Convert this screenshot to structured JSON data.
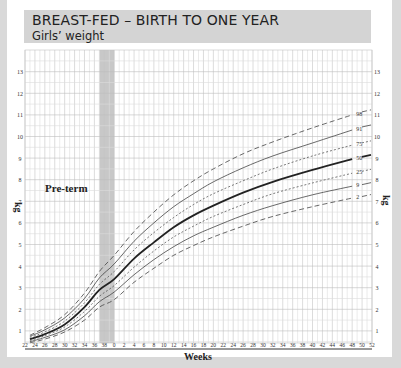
{
  "header": {
    "title": "BREAST-FED – BIRTH TO ONE YEAR",
    "subtitle": "Girls’ weight"
  },
  "chart_data": {
    "type": "line",
    "title": "BREAST-FED – BIRTH TO ONE YEAR",
    "subtitle": "Girls’ weight",
    "xlabel": "Weeks",
    "ylabel": "kg",
    "annotation": "Pre-term",
    "ylim": [
      0.4,
      13.8
    ],
    "y_ticks": [
      1,
      2,
      3,
      4,
      5,
      6,
      7,
      8,
      9,
      10,
      11,
      12,
      13
    ],
    "x_tick_labels": [
      "22",
      "24",
      "26",
      "28",
      "30",
      "32",
      "34",
      "36",
      "38",
      "0",
      "2",
      "4",
      "6",
      "8",
      "10",
      "12",
      "14",
      "16",
      "18",
      "20",
      "22",
      "24",
      "26",
      "28",
      "30",
      "32",
      "34",
      "36",
      "38",
      "40",
      "42",
      "44",
      "46",
      "48",
      "50",
      "52"
    ],
    "shaded_band": {
      "from_gest_week": 37,
      "to_gest_week": 40,
      "color": "#c8c8c8"
    },
    "grid": true,
    "x_note": "x values < 0 are gestational weeks before term (x = gestational week - 40); x >= 0 are postnatal weeks",
    "x": [
      -17,
      -14,
      -10,
      -6,
      -3,
      0,
      4,
      8,
      12,
      16,
      20,
      26,
      32,
      40,
      48
    ],
    "series": [
      {
        "name": "98",
        "style": "dashed",
        "values": [
          0.8,
          1.15,
          1.75,
          2.75,
          3.75,
          4.5,
          5.6,
          6.5,
          7.3,
          7.95,
          8.5,
          9.2,
          9.75,
          10.4,
          11.0
        ]
      },
      {
        "name": "91",
        "style": "solid",
        "values": [
          0.75,
          1.05,
          1.6,
          2.5,
          3.45,
          4.1,
          5.15,
          6.0,
          6.75,
          7.35,
          7.9,
          8.55,
          9.1,
          9.7,
          10.3
        ]
      },
      {
        "name": "75",
        "style": "dotted",
        "values": [
          0.7,
          0.95,
          1.45,
          2.3,
          3.15,
          3.75,
          4.75,
          5.55,
          6.25,
          6.85,
          7.35,
          7.95,
          8.5,
          9.1,
          9.6
        ]
      },
      {
        "name": "50",
        "style": "bold",
        "values": [
          0.62,
          0.85,
          1.3,
          2.1,
          2.9,
          3.4,
          4.35,
          5.1,
          5.8,
          6.35,
          6.8,
          7.4,
          7.9,
          8.45,
          8.95
        ]
      },
      {
        "name": "25",
        "style": "dotted",
        "values": [
          0.55,
          0.78,
          1.18,
          1.9,
          2.6,
          3.1,
          3.95,
          4.7,
          5.35,
          5.85,
          6.3,
          6.85,
          7.35,
          7.85,
          8.3
        ]
      },
      {
        "name": "9",
        "style": "solid",
        "values": [
          0.5,
          0.7,
          1.05,
          1.7,
          2.35,
          2.8,
          3.6,
          4.3,
          4.9,
          5.4,
          5.8,
          6.35,
          6.8,
          7.3,
          7.7
        ]
      },
      {
        "name": "2",
        "style": "dashed",
        "values": [
          0.45,
          0.62,
          0.95,
          1.5,
          2.1,
          2.45,
          3.25,
          3.9,
          4.5,
          4.95,
          5.35,
          5.85,
          6.3,
          6.75,
          7.15
        ]
      }
    ]
  }
}
